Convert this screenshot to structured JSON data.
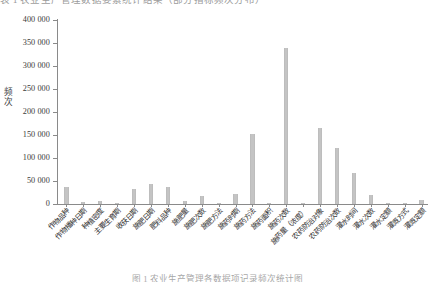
{
  "figure": {
    "top_caption": "表 1  农业生产管理数据要素统计结果（部分指标频次分布）",
    "bottom_caption": "图 1  农业生产管理各数据项记录频次统计图"
  },
  "chart_data": {
    "type": "bar",
    "title": "",
    "xlabel": "",
    "ylabel": "频次",
    "ylim": [
      0,
      400000
    ],
    "ytick_labels": [
      "0",
      "50 000",
      "100 000",
      "150 000",
      "200 000",
      "250 000",
      "300 000",
      "350 000",
      "400 000"
    ],
    "ytick_values": [
      0,
      50000,
      100000,
      150000,
      200000,
      250000,
      300000,
      350000,
      400000
    ],
    "grid": false,
    "legend": false,
    "bar_color": "#c4c4c4",
    "categories": [
      "作物品种",
      "作物播种日期",
      "种植密度",
      "主要生育期",
      "收获日期",
      "施肥日期",
      "肥料品种",
      "施肥量",
      "施肥次数",
      "施肥方法",
      "施药时期",
      "施药方法",
      "施药面积",
      "施药次数",
      "施药量（浓度）",
      "农药防治对象",
      "农药防治次数",
      "灌水时间",
      "灌水次数",
      "灌水定额",
      "灌溉方式",
      "灌溉定额"
    ],
    "values": [
      38000,
      5000,
      6000,
      2000,
      33000,
      44000,
      38000,
      7000,
      18000,
      1000,
      22000,
      152000,
      3000,
      339000,
      1000,
      165000,
      122000,
      68000,
      19000,
      3000,
      2000,
      8000
    ]
  }
}
